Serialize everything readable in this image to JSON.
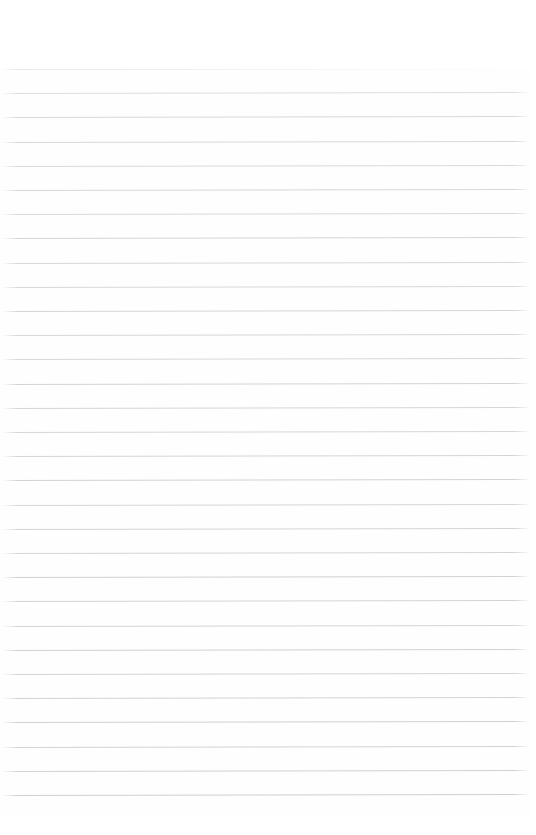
{
  "document": {
    "kind": "ruled-notebook-page-scan",
    "title": "",
    "body_text": "",
    "header_text": "",
    "footer_text": "",
    "page_number": "",
    "is_blank": true
  },
  "page": {
    "width": 536,
    "height": 835,
    "background_color": "#fefefe",
    "paper_color": "#ffffff"
  },
  "ruling": {
    "line_color": "#c9c9ce",
    "line_thickness_px": 1,
    "line_count": 32,
    "first_line_y": 69,
    "line_spacing_px": 24.2,
    "line_start_x": 2,
    "line_end_x": 530,
    "skew_degrees": -0.12,
    "top_margin_px": 69,
    "bottom_margin_px": 18,
    "left_margin_px": 2,
    "right_margin_px": 5,
    "line_opacities": [
      0.42,
      0.62,
      0.7,
      0.72,
      0.68,
      0.74,
      0.7,
      0.76,
      0.72,
      0.7,
      0.78,
      0.74,
      0.72,
      0.8,
      0.76,
      0.74,
      0.78,
      0.82,
      0.76,
      0.8,
      0.78,
      0.84,
      0.8,
      0.78,
      0.84,
      0.8,
      0.82,
      0.86,
      0.82,
      0.84,
      0.88,
      0.86
    ]
  }
}
